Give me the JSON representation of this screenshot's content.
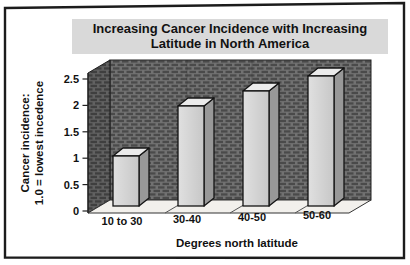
{
  "figure": {
    "type": "scanned-book-figure",
    "background": "#ffffff"
  },
  "chart_data": {
    "type": "bar",
    "style": "3d-column",
    "title": "Increasing Cancer Incidence with Increasing Latitude in North America",
    "title_lines": [
      "Increasing Cancer Incidence with Increasing",
      "Latitude in North America"
    ],
    "categories": [
      "10 to 30",
      "30-40",
      "40-50",
      "50-60"
    ],
    "values": [
      1.0,
      2.0,
      2.3,
      2.6
    ],
    "xlabel": "Degrees north latitude",
    "ylabel_lines": [
      "Cancer incidence:",
      "1.0 = lowest incedence"
    ],
    "y_ticks": [
      "0",
      "0.5",
      "1",
      "1.5",
      "2",
      "2.5"
    ],
    "ylim": [
      0,
      2.6
    ],
    "grid": false,
    "legend": "none",
    "colors": {
      "bar_front": "#d3d3d3",
      "bar_front_light": "#e0e0e0",
      "bar_top": "#ebebeb",
      "bar_side": "#989898",
      "wall_base": "#717171",
      "wall_dash": "#4a4a4a",
      "floor": "#f2f0ec",
      "outline": "#141414",
      "title_band": "#d9d9d9",
      "frame": "#1c1c1c"
    }
  }
}
